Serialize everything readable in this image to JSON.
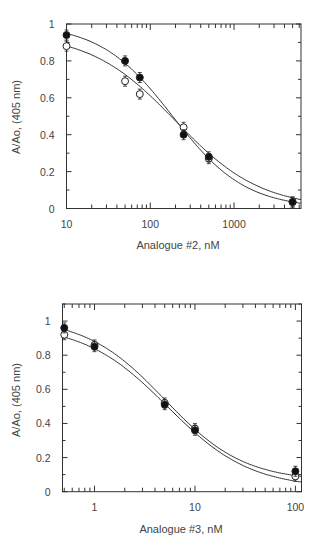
{
  "chart_data": [
    {
      "type": "scatter",
      "title": "",
      "xlabel": "Analogue #2, nM",
      "ylabel": "A/Ao, (405 nm)",
      "xscale": "log",
      "xlim": [
        10,
        6300
      ],
      "ylim": [
        0,
        1
      ],
      "xticks": [
        10,
        100,
        1000
      ],
      "xtick_labels": [
        "10",
        "100",
        "1000"
      ],
      "yticks": [
        0,
        0.2,
        0.4,
        0.6,
        0.8,
        1
      ],
      "ytick_labels": [
        "0",
        "0.2",
        "0.4",
        "0.6",
        "0.8",
        "1"
      ],
      "grid": false,
      "legend": null,
      "series": [
        {
          "name": "filled circles",
          "marker": "filled-circle",
          "x": [
            10,
            50,
            75,
            250,
            500,
            5000
          ],
          "y": [
            0.94,
            0.8,
            0.71,
            0.4,
            0.28,
            0.035
          ],
          "fit": {
            "model": "hill",
            "top": 1.0,
            "bottom": 0.0,
            "ic50": 185,
            "n": 1.0
          }
        },
        {
          "name": "open circles",
          "marker": "open-circle",
          "x": [
            10,
            50,
            75,
            250,
            500,
            5000
          ],
          "y": [
            0.88,
            0.69,
            0.62,
            0.44,
            0.27,
            0.035
          ],
          "fit": {
            "model": "hill",
            "top": 0.95,
            "bottom": 0.0,
            "ic50": 200,
            "n": 0.85
          }
        }
      ]
    },
    {
      "type": "scatter",
      "title": "",
      "xlabel": "Analogue #3, nM",
      "ylabel": "A/Ao, (405 nm)",
      "xscale": "log",
      "xlim": [
        0.48,
        115
      ],
      "ylim": [
        0,
        1.1
      ],
      "xticks": [
        1,
        10,
        100
      ],
      "xtick_labels": [
        "1",
        "10",
        "100"
      ],
      "yticks": [
        0,
        0.2,
        0.4,
        0.6,
        0.8,
        1
      ],
      "ytick_labels": [
        "0",
        "0.2",
        "0.4",
        "0.6",
        "0.8",
        "1"
      ],
      "grid": false,
      "legend": null,
      "series": [
        {
          "name": "filled circles",
          "marker": "filled-circle",
          "x": [
            0.5,
            1,
            5,
            10,
            100
          ],
          "y": [
            0.96,
            0.85,
            0.51,
            0.36,
            0.12
          ],
          "fit": {
            "model": "hill",
            "top": 1.02,
            "bottom": 0.06,
            "ic50": 5.0,
            "n": 1.1
          }
        },
        {
          "name": "open circles",
          "marker": "open-circle",
          "x": [
            0.5,
            1,
            5,
            10,
            100
          ],
          "y": [
            0.92,
            0.86,
            0.52,
            0.37,
            0.09
          ],
          "fit": {
            "model": "hill",
            "top": 0.98,
            "bottom": 0.02,
            "ic50": 5.3,
            "n": 1.05
          }
        }
      ]
    }
  ]
}
